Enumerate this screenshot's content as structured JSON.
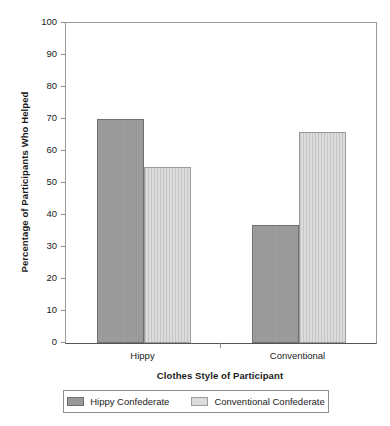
{
  "chart_data": {
    "type": "bar",
    "title": "",
    "xlabel": "Clothes Style of Participant",
    "ylabel": "Percentage of Participants Who Helped",
    "categories": [
      "Hippy",
      "Conventional"
    ],
    "series": [
      {
        "name": "Hippy Confederate",
        "values": [
          70,
          37
        ],
        "color": "#999999"
      },
      {
        "name": "Conventional Confederate",
        "values": [
          55,
          66
        ],
        "color": "#dcdcdc"
      }
    ],
    "ylim": [
      0,
      100
    ],
    "yticks": [
      "0",
      "10",
      "20",
      "30",
      "40",
      "50",
      "60",
      "70",
      "80",
      "90",
      "100"
    ],
    "ytick_values": [
      0,
      10,
      20,
      30,
      40,
      50,
      60,
      70,
      80,
      90,
      100
    ],
    "grid": false,
    "legend_position": "bottom"
  },
  "axes": {
    "y_title": "Percentage of Participants Who Helped",
    "x_title": "Clothes Style of Participant"
  },
  "legend": {
    "entries": [
      {
        "label": "Hippy Confederate"
      },
      {
        "label": "Conventional Confederate"
      }
    ]
  },
  "colors": {
    "series_dark": "#999999",
    "series_light": "#dcdcdc",
    "axis": "#8c8c8c",
    "baseline": "#555555",
    "text": "#1a1a1a",
    "background": "#ffffff"
  }
}
